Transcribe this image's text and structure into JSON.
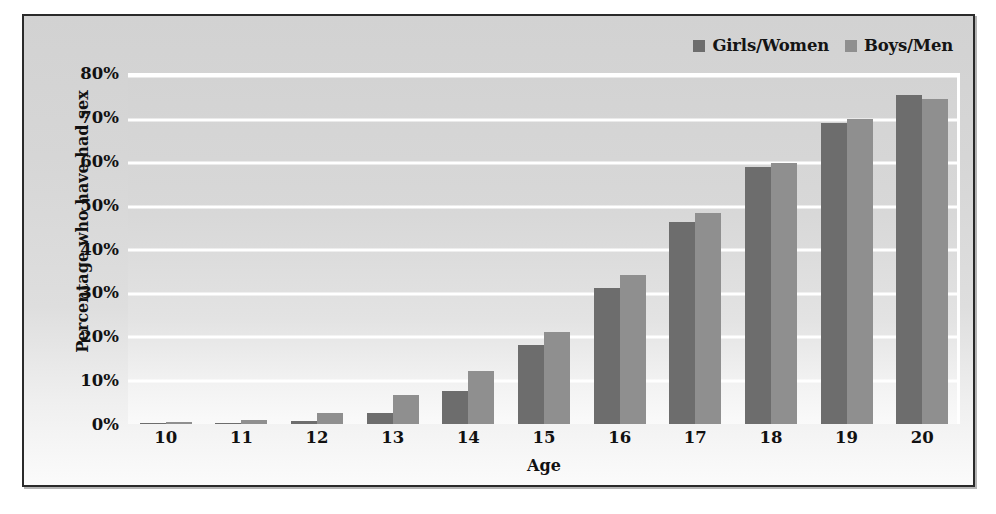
{
  "chart_data": {
    "type": "bar",
    "title": "",
    "xlabel": "Age",
    "ylabel": "Percentage who have had sex",
    "categories": [
      "10",
      "11",
      "12",
      "13",
      "14",
      "15",
      "16",
      "17",
      "18",
      "19",
      "20"
    ],
    "series": [
      {
        "name": "Girls/Women",
        "color": "#6d6d6d",
        "values": [
          0.2,
          0.3,
          0.7,
          2.5,
          7.5,
          18,
          31,
          46,
          58.5,
          68.5,
          75
        ]
      },
      {
        "name": "Boys/Men",
        "color": "#8f8f8f",
        "values": [
          0.4,
          1,
          2.5,
          6.5,
          12,
          21,
          34,
          48,
          59.5,
          69.5,
          74
        ]
      }
    ],
    "ylim": [
      0,
      80
    ],
    "ytick_step": 10,
    "ytick_labels": [
      "80%",
      "70%",
      "60%",
      "50%",
      "40%",
      "30%",
      "20%",
      "10%",
      "0%"
    ],
    "ytick_values": [
      80,
      70,
      60,
      50,
      40,
      30,
      20,
      10,
      0
    ],
    "grid": true,
    "gridline_color": "#ffffff",
    "legend_position": "top-right",
    "plot_background": "#d8d8d8"
  },
  "legend": {
    "entries": [
      {
        "label": "Girls/Women",
        "swatch": "#6d6d6d"
      },
      {
        "label": "Boys/Men",
        "swatch": "#8f8f8f"
      }
    ]
  }
}
